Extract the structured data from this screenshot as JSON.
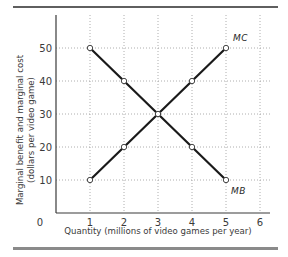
{
  "chart_data": {
    "type": "line",
    "title": "",
    "xlabel": "Quantity (millions of video games per year)",
    "ylabel": "Marginal benefit and marginal cost",
    "ylabel_line2": "(dollars per video game)",
    "x_ticks": [
      "0",
      "1",
      "2",
      "3",
      "4",
      "5",
      "6"
    ],
    "y_ticks": [
      "10",
      "20",
      "30",
      "40",
      "50"
    ],
    "xlim": [
      0,
      6
    ],
    "ylim": [
      0,
      55
    ],
    "grid": true,
    "series": [
      {
        "name": "MC",
        "x": [
          1,
          2,
          3,
          4,
          5
        ],
        "values": [
          10,
          20,
          30,
          40,
          50
        ]
      },
      {
        "name": "MB",
        "x": [
          1,
          2,
          3,
          4,
          5
        ],
        "values": [
          50,
          40,
          30,
          20,
          10
        ]
      }
    ],
    "annotations": [
      {
        "text": "MC",
        "x": 5,
        "y": 50,
        "position": "above-right"
      },
      {
        "text": "MB",
        "x": 5,
        "y": 10,
        "position": "below-right"
      }
    ]
  },
  "colors": {
    "line": "#1a1a1a",
    "grid": "#9a9a9a",
    "axis": "#3a3a3a",
    "top_rule": "#2a2a2a",
    "bottom_bar": "#8a8a8a"
  }
}
